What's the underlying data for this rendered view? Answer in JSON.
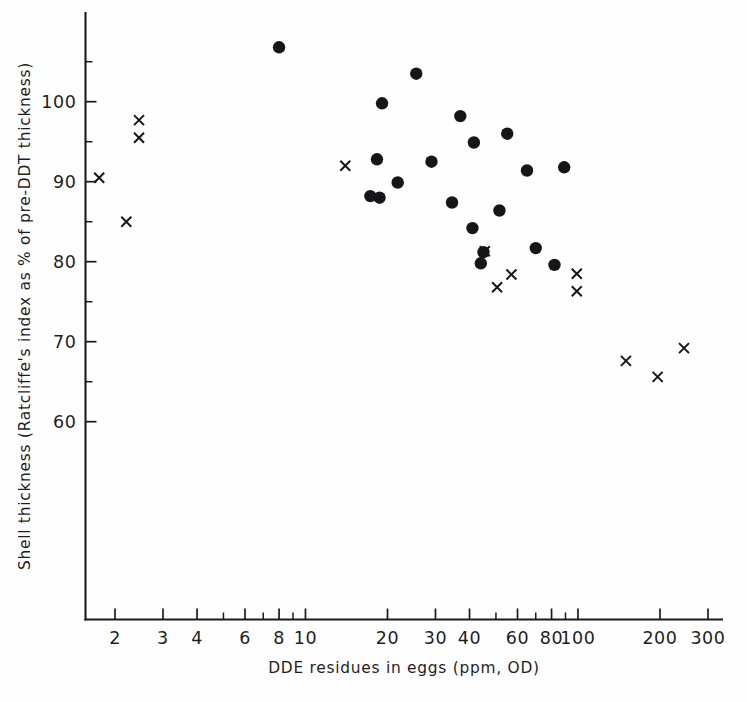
{
  "chart_data": {
    "type": "scatter",
    "title": "",
    "xlabel": "DDE residues in eggs  (ppm, OD)",
    "ylabel": "Shell thickness (Ratcliffe's index as % of pre-DDT thickness)",
    "xscale": "log",
    "yscale": "linear",
    "xlim": [
      1.6,
      320
    ],
    "ylim": [
      54,
      108
    ],
    "grid": false,
    "legend_position": "none",
    "x_ticks_labeled": [
      2,
      3,
      4,
      6,
      8,
      10,
      20,
      30,
      40,
      60,
      80,
      100,
      200,
      300
    ],
    "x_tick_labels": [
      "2",
      "3",
      "4",
      "6",
      "8",
      "10",
      "20",
      "30",
      "40",
      "60",
      "80",
      "100",
      "200",
      "300"
    ],
    "x_ticks_minor": [
      5,
      7,
      9,
      50,
      70,
      90
    ],
    "y_ticks_labeled": [
      60,
      70,
      80,
      90,
      100
    ],
    "y_tick_labels": [
      "60",
      "70",
      "80",
      "90",
      "100"
    ],
    "y_ticks_minor": [
      65,
      75,
      85,
      95,
      105
    ],
    "series": [
      {
        "name": "filled-circle",
        "marker": "circle",
        "color": "#16161a",
        "points": [
          [
            8.0,
            106.8
          ],
          [
            25.5,
            103.5
          ],
          [
            19.1,
            99.8
          ],
          [
            37.0,
            98.2
          ],
          [
            55.0,
            96.0
          ],
          [
            41.5,
            94.9
          ],
          [
            18.3,
            92.8
          ],
          [
            29.0,
            92.5
          ],
          [
            65.0,
            91.4
          ],
          [
            89.0,
            91.8
          ],
          [
            21.8,
            89.9
          ],
          [
            17.3,
            88.2
          ],
          [
            18.7,
            88.0
          ],
          [
            34.5,
            87.4
          ],
          [
            51.5,
            86.4
          ],
          [
            41.0,
            84.2
          ],
          [
            45.0,
            81.2
          ],
          [
            70.0,
            81.7
          ],
          [
            44.0,
            79.8
          ],
          [
            82.0,
            79.6
          ]
        ]
      },
      {
        "name": "cross",
        "marker": "x",
        "color": "#16161a",
        "points": [
          [
            1.75,
            90.5
          ],
          [
            2.45,
            97.7
          ],
          [
            2.45,
            95.5
          ],
          [
            2.2,
            85.0
          ],
          [
            14.0,
            92.0
          ],
          [
            45.5,
            81.3
          ],
          [
            57.0,
            78.4
          ],
          [
            99.0,
            78.5
          ],
          [
            50.5,
            76.8
          ],
          [
            99.0,
            76.3
          ],
          [
            150.0,
            67.6
          ],
          [
            196.0,
            65.6
          ],
          [
            245.0,
            69.2
          ]
        ]
      }
    ]
  },
  "axes": {
    "x_axis_label": "DDE residues in eggs  (ppm, OD)",
    "y_axis_label": "Shell thickness (Ratcliffe's index as % of pre-DDT thickness)"
  }
}
